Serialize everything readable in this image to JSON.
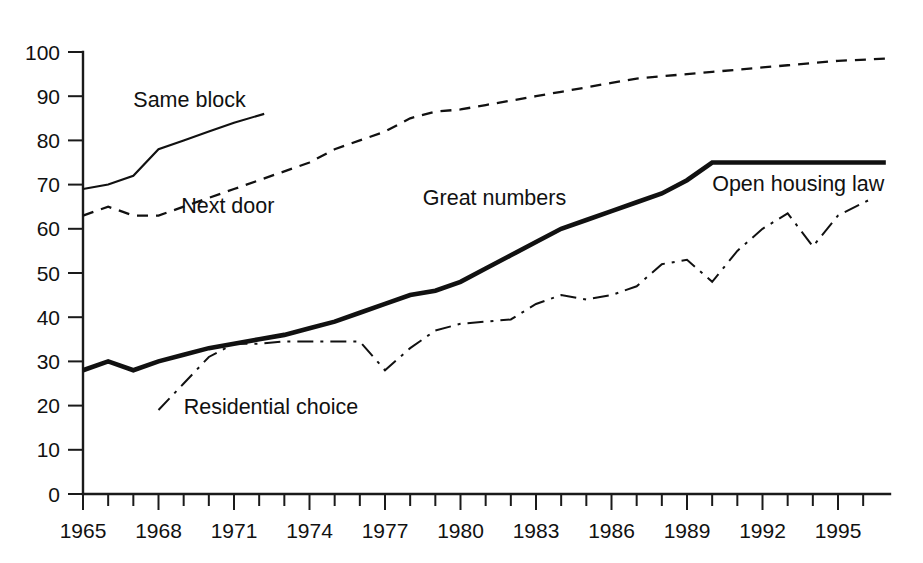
{
  "chart_data": {
    "type": "line",
    "title": "",
    "subtitle": "",
    "xlabel": "",
    "ylabel": "",
    "xlim": [
      1965,
      1997
    ],
    "ylim": [
      0,
      100
    ],
    "grid": false,
    "legend_position": "inline-annotations",
    "y_ticks": [
      0,
      10,
      20,
      30,
      40,
      50,
      60,
      70,
      80,
      90,
      100
    ],
    "y_tick_labels": [
      "0",
      "10",
      "20",
      "30",
      "40",
      "50",
      "60",
      "70",
      "80",
      "90",
      "100"
    ],
    "x_ticks": [
      1965,
      1966,
      1967,
      1968,
      1969,
      1970,
      1971,
      1972,
      1973,
      1974,
      1975,
      1976,
      1977,
      1978,
      1979,
      1980,
      1981,
      1982,
      1983,
      1984,
      1985,
      1986,
      1987,
      1988,
      1989,
      1990,
      1991,
      1992,
      1993,
      1994,
      1995,
      1996
    ],
    "x_tick_labels": [
      "1965",
      "1968",
      "1971",
      "1974",
      "1977",
      "1980",
      "1983",
      "1986",
      "1989",
      "1992",
      "1995"
    ],
    "x_labeled_ticks": [
      1965,
      1968,
      1971,
      1974,
      1977,
      1980,
      1983,
      1986,
      1989,
      1992,
      1995
    ],
    "series": [
      {
        "name": "Same block",
        "style": "thin-solid",
        "label": "Same block",
        "label_x": 1967.0,
        "label_y": 87.5,
        "x": [
          1965,
          1966,
          1967,
          1968,
          1969,
          1970,
          1971,
          1972.2
        ],
        "values": [
          69,
          70,
          72,
          78,
          80,
          82,
          84,
          86
        ]
      },
      {
        "name": "Next door",
        "style": "dashed",
        "label": "Next door",
        "label_x": 1968.9,
        "label_y": 63.5,
        "x": [
          1965,
          1966,
          1967,
          1968,
          1969,
          1970,
          1971,
          1972,
          1973,
          1974,
          1975,
          1976,
          1977,
          1978,
          1979,
          1980,
          1981,
          1982,
          1983,
          1984,
          1985,
          1986,
          1987,
          1988,
          1989,
          1990,
          1991,
          1992,
          1993,
          1994,
          1995,
          1996.9
        ],
        "values": [
          63,
          65,
          63,
          63,
          65,
          67,
          69,
          71,
          73,
          75,
          78,
          80,
          82,
          85,
          86.5,
          87,
          88,
          89,
          90,
          91,
          92,
          93,
          94,
          94.5,
          95,
          95.5,
          96,
          96.5,
          97,
          97.5,
          98,
          98.5
        ]
      },
      {
        "name": "Great numbers",
        "style": "thick-solid",
        "label": "Great numbers",
        "label_x": 1978.5,
        "label_y": 65.5,
        "x": [
          1965,
          1966,
          1967,
          1968,
          1969,
          1970,
          1971,
          1972,
          1973,
          1974,
          1975,
          1976,
          1977,
          1978,
          1979,
          1980,
          1981,
          1982,
          1983,
          1984,
          1985,
          1986,
          1987,
          1988,
          1989,
          1990,
          1991,
          1992,
          1993,
          1994,
          1995,
          1996.9
        ],
        "values": [
          28,
          30,
          28,
          30,
          31.5,
          33,
          34,
          35,
          36,
          37.5,
          39,
          41,
          43,
          45,
          46,
          48,
          51,
          54,
          57,
          60,
          62,
          64,
          66,
          68,
          71,
          75,
          75,
          75,
          75,
          75,
          75,
          75
        ]
      },
      {
        "name": "Residential choice",
        "style": "dash-dot",
        "label": "Residential choice",
        "label_x": 1969.0,
        "label_y": 18.0,
        "x": [
          1968,
          1969,
          1970,
          1971,
          1972,
          1973,
          1974,
          1975,
          1976,
          1977,
          1978,
          1979,
          1980,
          1981,
          1982,
          1983,
          1984,
          1985,
          1986,
          1987,
          1988,
          1989,
          1990,
          1991,
          1992,
          1993,
          1994,
          1995,
          1996.4
        ],
        "values": [
          19,
          25,
          31,
          34,
          34,
          34.5,
          34.5,
          34.5,
          34.5,
          28,
          33,
          37,
          38.5,
          39,
          39.5,
          43,
          45,
          44,
          45,
          47,
          52,
          53,
          48,
          55,
          60,
          63.5,
          56,
          63,
          67
        ]
      }
    ],
    "annotations": [
      {
        "text": "Open housing law",
        "x": 1990.0,
        "y": 68.5
      }
    ]
  }
}
